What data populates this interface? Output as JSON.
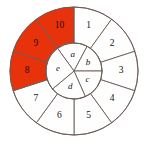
{
  "figure": {
    "geometry": {
      "center_x": 74,
      "center_y": 71,
      "outer_radius": 64,
      "inner_radius": 28,
      "outer_segment_count": 10,
      "inner_segment_count": 5,
      "outer_start_angle_deg": 90,
      "outer_direction": "clockwise"
    },
    "colors": {
      "highlight": "#e8320c",
      "plain": "#fefefe",
      "stroke": "#6b5b55",
      "label": "#17130f",
      "background": "#ffffff"
    }
  },
  "outer_ring": {
    "name": "outer-ring",
    "segments": [
      {
        "label": "1",
        "highlighted": false
      },
      {
        "label": "2",
        "highlighted": false
      },
      {
        "label": "3",
        "highlighted": false
      },
      {
        "label": "4",
        "highlighted": false
      },
      {
        "label": "5",
        "highlighted": false
      },
      {
        "label": "6",
        "highlighted": false
      },
      {
        "label": "7",
        "highlighted": false
      },
      {
        "label": "8",
        "highlighted": true
      },
      {
        "label": "9",
        "highlighted": true
      },
      {
        "label": "10",
        "highlighted": true
      }
    ]
  },
  "inner_ring": {
    "name": "inner-ring",
    "segments": [
      {
        "label": "a"
      },
      {
        "label": "b"
      },
      {
        "label": "c"
      },
      {
        "label": "d"
      },
      {
        "label": "e"
      }
    ]
  }
}
